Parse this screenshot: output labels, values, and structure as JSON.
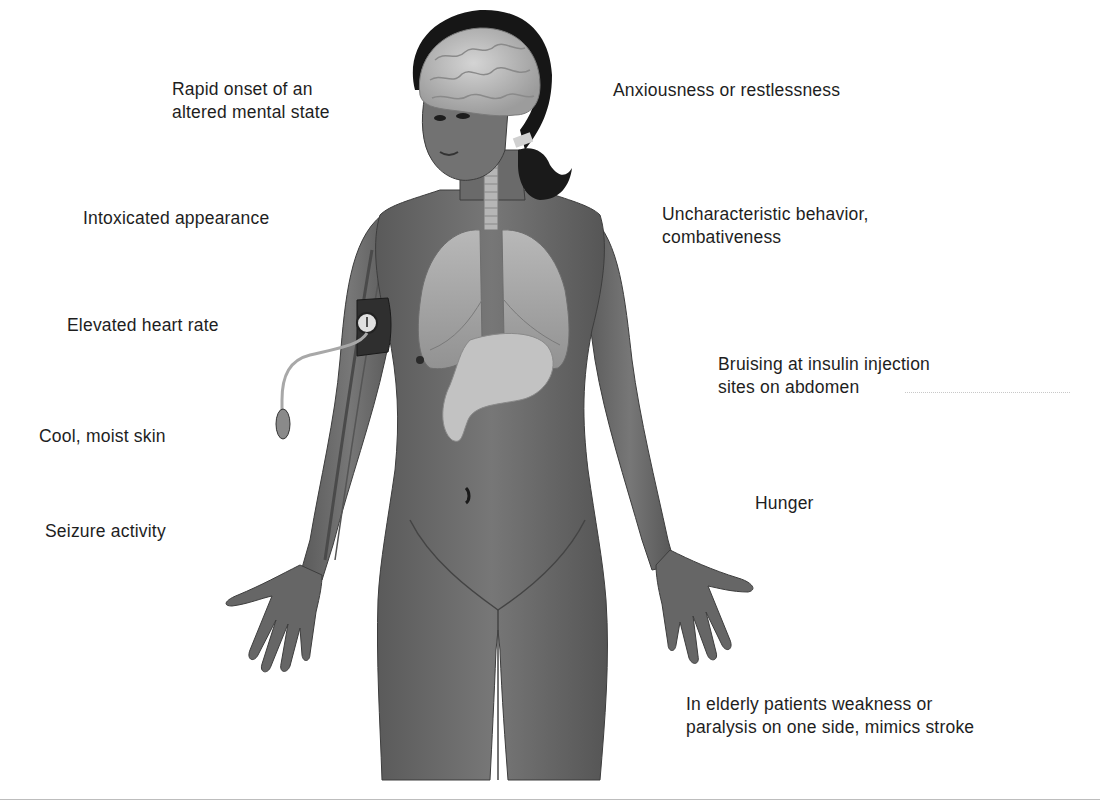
{
  "diagram": {
    "colors": {
      "skin": "#6b6b6b",
      "skin_dark": "#4a4a4a",
      "organ": "#a9a9a9",
      "organ_light": "#c4c4c4",
      "hair": "#141414",
      "text": "#1e1e1e",
      "background": "#ffffff"
    },
    "figure_icons": [
      "brain-icon",
      "lungs-icon",
      "stomach-icon",
      "trachea-icon",
      "blood-pressure-cuff-icon",
      "inflation-bulb-icon"
    ],
    "labels": {
      "left": [
        {
          "lines": [
            "Rapid onset of an",
            "altered mental state"
          ]
        },
        {
          "lines": [
            "Intoxicated appearance"
          ]
        },
        {
          "lines": [
            "Elevated heart rate"
          ]
        },
        {
          "lines": [
            "Cool, moist skin"
          ]
        },
        {
          "lines": [
            "Seizure activity"
          ]
        }
      ],
      "right": [
        {
          "lines": [
            "Anxiousness or restlessness"
          ]
        },
        {
          "lines": [
            "Uncharacteristic behavior,",
            "combativeness"
          ]
        },
        {
          "lines": [
            "Bruising at insulin injection",
            "sites on abdomen"
          ]
        },
        {
          "lines": [
            "Hunger"
          ]
        },
        {
          "lines": [
            "In elderly patients weakness or",
            "paralysis on one side, mimics stroke"
          ]
        }
      ]
    }
  }
}
